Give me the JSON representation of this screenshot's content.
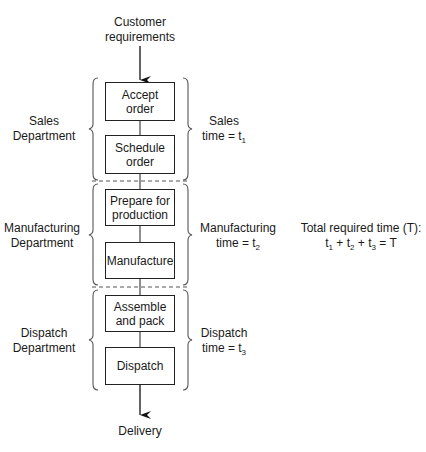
{
  "diagram": {
    "input": {
      "line1": "Customer",
      "line2": "requirements"
    },
    "output": "Delivery",
    "departments": [
      {
        "name_line1": "Sales",
        "name_line2": "Department",
        "time_line1": "Sales",
        "time_prefix": "time = t",
        "time_sub": "1",
        "steps": [
          {
            "line1": "Accept",
            "line2": "order"
          },
          {
            "line1": "Schedule",
            "line2": "order"
          }
        ]
      },
      {
        "name_line1": "Manufacturing",
        "name_line2": "Department",
        "time_line1": "Manufacturing",
        "time_prefix": "time = t",
        "time_sub": "2",
        "steps": [
          {
            "line1": "Prepare for",
            "line2": "production"
          },
          {
            "line1": "Manufacture",
            "line2": ""
          }
        ]
      },
      {
        "name_line1": "Dispatch",
        "name_line2": "Department",
        "time_line1": "Dispatch",
        "time_prefix": "time = t",
        "time_sub": "3",
        "steps": [
          {
            "line1": "Assemble",
            "line2": "and pack"
          },
          {
            "line1": "Dispatch",
            "line2": ""
          }
        ]
      }
    ],
    "total": {
      "title": "Total required time (T):",
      "t1": "t",
      "s1": "1",
      "plus1": " + t",
      "s2": "2",
      "plus2": " + t",
      "s3": "3",
      "eq": " = T"
    },
    "colors": {
      "stroke": "#222222",
      "background": "#ffffff"
    }
  }
}
